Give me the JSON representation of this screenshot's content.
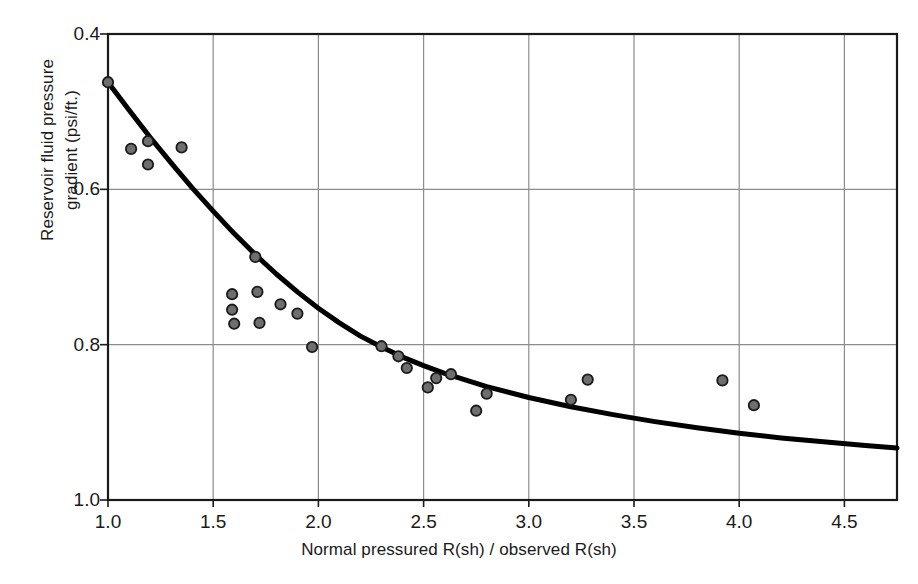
{
  "chart_data": {
    "type": "scatter",
    "title": "",
    "xlabel": "Normal pressured R(sh) / observed R(sh)",
    "ylabel_line1": "Reservoir fluid pressure",
    "ylabel_line2": "gradient (psi/ft.)",
    "xlim": [
      1.0,
      4.75
    ],
    "ylim": [
      1.0,
      0.4
    ],
    "y_inverted": true,
    "grid": true,
    "legend": "none",
    "xticks": [
      1.0,
      1.5,
      2.0,
      2.5,
      3.0,
      3.5,
      4.0,
      4.5
    ],
    "xticklabels": [
      "1.0",
      "1.5",
      "2.0",
      "2.5",
      "3.0",
      "3.5",
      "4.0",
      "4.5"
    ],
    "yticks": [
      0.4,
      0.6,
      0.8,
      1.0
    ],
    "yticklabels": [
      "0.4",
      "0.6",
      "0.8",
      "1.0"
    ],
    "series": [
      {
        "name": "Field data points",
        "type": "scatter",
        "marker": "circle",
        "marker_face_color": "#6e6e6e",
        "marker_edge_color": "#1a1a1a",
        "points": [
          {
            "x": 1.0,
            "y": 0.462
          },
          {
            "x": 1.11,
            "y": 0.548
          },
          {
            "x": 1.19,
            "y": 0.538
          },
          {
            "x": 1.19,
            "y": 0.568
          },
          {
            "x": 1.35,
            "y": 0.546
          },
          {
            "x": 1.59,
            "y": 0.735
          },
          {
            "x": 1.59,
            "y": 0.755
          },
          {
            "x": 1.6,
            "y": 0.773
          },
          {
            "x": 1.7,
            "y": 0.687
          },
          {
            "x": 1.71,
            "y": 0.732
          },
          {
            "x": 1.72,
            "y": 0.772
          },
          {
            "x": 1.82,
            "y": 0.748
          },
          {
            "x": 1.9,
            "y": 0.76
          },
          {
            "x": 1.97,
            "y": 0.803
          },
          {
            "x": 2.3,
            "y": 0.802
          },
          {
            "x": 2.38,
            "y": 0.815
          },
          {
            "x": 2.42,
            "y": 0.83
          },
          {
            "x": 2.52,
            "y": 0.855
          },
          {
            "x": 2.56,
            "y": 0.843
          },
          {
            "x": 2.63,
            "y": 0.838
          },
          {
            "x": 2.75,
            "y": 0.885
          },
          {
            "x": 2.8,
            "y": 0.863
          },
          {
            "x": 3.2,
            "y": 0.871
          },
          {
            "x": 3.28,
            "y": 0.845
          },
          {
            "x": 3.92,
            "y": 0.846
          },
          {
            "x": 4.07,
            "y": 0.878
          }
        ]
      },
      {
        "name": "Fitted trend curve",
        "type": "line",
        "color": "#000000",
        "width": 5,
        "points": [
          {
            "x": 1.0,
            "y": 0.462
          },
          {
            "x": 1.1,
            "y": 0.498
          },
          {
            "x": 1.2,
            "y": 0.533
          },
          {
            "x": 1.3,
            "y": 0.566
          },
          {
            "x": 1.4,
            "y": 0.598
          },
          {
            "x": 1.5,
            "y": 0.628
          },
          {
            "x": 1.6,
            "y": 0.657
          },
          {
            "x": 1.7,
            "y": 0.684
          },
          {
            "x": 1.8,
            "y": 0.709
          },
          {
            "x": 1.9,
            "y": 0.732
          },
          {
            "x": 2.0,
            "y": 0.753
          },
          {
            "x": 2.1,
            "y": 0.772
          },
          {
            "x": 2.2,
            "y": 0.789
          },
          {
            "x": 2.3,
            "y": 0.803
          },
          {
            "x": 2.4,
            "y": 0.816
          },
          {
            "x": 2.5,
            "y": 0.827
          },
          {
            "x": 2.6,
            "y": 0.837
          },
          {
            "x": 2.8,
            "y": 0.854
          },
          {
            "x": 3.0,
            "y": 0.868
          },
          {
            "x": 3.2,
            "y": 0.88
          },
          {
            "x": 3.4,
            "y": 0.89
          },
          {
            "x": 3.6,
            "y": 0.899
          },
          {
            "x": 3.8,
            "y": 0.907
          },
          {
            "x": 4.0,
            "y": 0.914
          },
          {
            "x": 4.2,
            "y": 0.92
          },
          {
            "x": 4.4,
            "y": 0.925
          },
          {
            "x": 4.6,
            "y": 0.93
          },
          {
            "x": 4.75,
            "y": 0.933
          }
        ]
      }
    ],
    "colors": {
      "axis": "#1a1a1a",
      "grid": "#8c8c8c",
      "curve": "#000000",
      "marker_fill": "#6e6e6e",
      "background": "#ffffff"
    }
  }
}
